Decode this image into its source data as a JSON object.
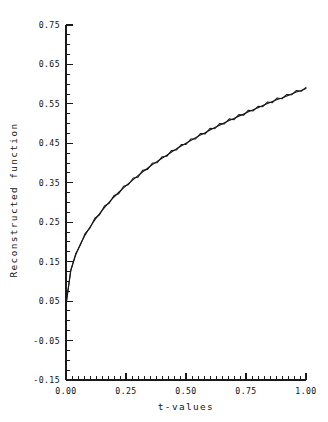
{
  "chart_data": {
    "type": "line",
    "title": "",
    "xlabel": "t-values",
    "ylabel": "Reconstructed function",
    "xlim": [
      0.0,
      1.0
    ],
    "ylim": [
      -0.15,
      0.75
    ],
    "grid": false,
    "legend": "none",
    "x_ticks": [
      0.0,
      0.25,
      0.5,
      0.75,
      1.0
    ],
    "x_tick_labels": [
      "0.00",
      "0.25",
      "0.50",
      "0.75",
      "1.00"
    ],
    "x_minor_step": 0.025,
    "y_ticks": [
      -0.15,
      -0.05,
      0.05,
      0.15,
      0.25,
      0.35,
      0.45,
      0.55,
      0.65,
      0.75
    ],
    "y_tick_labels": [
      "-0.15",
      "-0.05",
      "0.05",
      "0.15",
      "0.25",
      "0.35",
      "0.45",
      "0.55",
      "0.65",
      "0.75"
    ],
    "y_minor_step": 0.025,
    "series": [
      {
        "name": "true function",
        "style": "smooth",
        "x": [
          0.0,
          0.02,
          0.04,
          0.06,
          0.08,
          0.1,
          0.12,
          0.14,
          0.16,
          0.18,
          0.2,
          0.22,
          0.24,
          0.26,
          0.28,
          0.3,
          0.32,
          0.34,
          0.36,
          0.38,
          0.4,
          0.42,
          0.44,
          0.46,
          0.48,
          0.5,
          0.52,
          0.54,
          0.56,
          0.58,
          0.6,
          0.62,
          0.64,
          0.66,
          0.68,
          0.7,
          0.72,
          0.74,
          0.76,
          0.78,
          0.8,
          0.82,
          0.84,
          0.86,
          0.88,
          0.9,
          0.92,
          0.94,
          0.96,
          0.98,
          1.0
        ],
        "y": [
          0.04,
          0.129,
          0.166,
          0.195,
          0.218,
          0.238,
          0.256,
          0.272,
          0.287,
          0.301,
          0.314,
          0.326,
          0.337,
          0.348,
          0.358,
          0.368,
          0.378,
          0.387,
          0.396,
          0.404,
          0.412,
          0.42,
          0.428,
          0.436,
          0.443,
          0.45,
          0.457,
          0.464,
          0.471,
          0.477,
          0.484,
          0.49,
          0.496,
          0.502,
          0.508,
          0.513,
          0.519,
          0.524,
          0.53,
          0.535,
          0.54,
          0.546,
          0.551,
          0.556,
          0.561,
          0.565,
          0.57,
          0.575,
          0.58,
          0.584,
          0.589
        ]
      },
      {
        "name": "reconstruction",
        "style": "noisy",
        "x": [
          0.0,
          0.02,
          0.04,
          0.06,
          0.08,
          0.1,
          0.12,
          0.14,
          0.16,
          0.18,
          0.2,
          0.22,
          0.24,
          0.26,
          0.28,
          0.3,
          0.32,
          0.34,
          0.36,
          0.38,
          0.4,
          0.42,
          0.44,
          0.46,
          0.48,
          0.5,
          0.52,
          0.54,
          0.56,
          0.58,
          0.6,
          0.62,
          0.64,
          0.66,
          0.68,
          0.7,
          0.72,
          0.74,
          0.76,
          0.78,
          0.8,
          0.82,
          0.84,
          0.86,
          0.88,
          0.9,
          0.92,
          0.94,
          0.96,
          0.98,
          1.0
        ],
        "y": [
          0.042,
          0.127,
          0.17,
          0.192,
          0.222,
          0.235,
          0.26,
          0.269,
          0.291,
          0.298,
          0.318,
          0.322,
          0.341,
          0.345,
          0.362,
          0.364,
          0.382,
          0.384,
          0.4,
          0.401,
          0.416,
          0.417,
          0.432,
          0.433,
          0.447,
          0.447,
          0.461,
          0.461,
          0.475,
          0.474,
          0.488,
          0.487,
          0.5,
          0.499,
          0.512,
          0.51,
          0.523,
          0.521,
          0.534,
          0.532,
          0.544,
          0.543,
          0.555,
          0.553,
          0.565,
          0.563,
          0.574,
          0.573,
          0.584,
          0.582,
          0.592
        ]
      }
    ]
  }
}
